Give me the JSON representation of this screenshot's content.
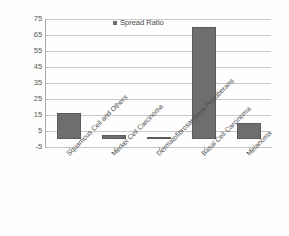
{
  "chart_data": {
    "type": "bar",
    "title": "",
    "xlabel": "",
    "ylabel": "",
    "categories": [
      "Squamous Cell and Others",
      "Merkel Cell Carcinoma",
      "Dermatofibrosarcoma Protuberans",
      "Basal Cell Carcinoma",
      "Melanoma"
    ],
    "series": [
      {
        "name": "Spread Ratio",
        "values": [
          16.5,
          2.5,
          1,
          70,
          10
        ]
      }
    ],
    "values": [
      16.5,
      2.5,
      1,
      70,
      10
    ],
    "ylim": [
      -5,
      75
    ],
    "yticks": [
      75,
      65,
      55,
      45,
      35,
      25,
      15,
      5,
      -5
    ],
    "ytick_labels": [
      "75",
      "65",
      "55",
      "45",
      "35",
      "25",
      "15",
      "5",
      "-5"
    ],
    "grid": true,
    "legend": {
      "position": "top-center",
      "entries": [
        "Spread Ratio"
      ]
    },
    "colors": {
      "bar": "#6e6e6e",
      "gridline": "#c8c8c8",
      "axis": "#a9a9a9",
      "text": "#4d4d4d",
      "background": "#ffffff"
    }
  }
}
